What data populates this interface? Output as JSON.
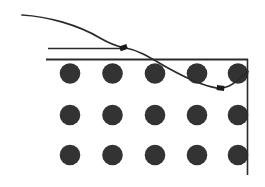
{
  "figure": {
    "title": "Descending curve over circular element array",
    "width": 265,
    "height": 187,
    "background_color": "#ffffff",
    "ink_color": "#2b2b2b",
    "circle_color": "#333333",
    "marker_color": "#1a1a1a"
  },
  "frame": {
    "name": "boundary-frame",
    "top_line": {
      "x1": 46,
      "y1": 59.5,
      "x2": 248,
      "y2": 59.5,
      "stroke_width": 2.0
    },
    "right_line": {
      "x1": 247.5,
      "y1": 59,
      "x2": 247.5,
      "y2": 175,
      "stroke_width": 1.6
    }
  },
  "guide_line": {
    "name": "upper-guide-line",
    "x1": 48,
    "y1": 48.5,
    "x2": 126,
    "y2": 48.5,
    "stroke_width": 1.6
  },
  "curve": {
    "name": "descending-profile-curve",
    "stroke_width": 1.7,
    "path": "M 22 15 C 48 16.5, 78 25, 100 38 C 112 45, 118 46.5, 124 47.5 C 140 50.5, 152 59, 168 68 C 186 78, 202 85.5, 216 87.8 C 221 88.4, 225 88.0, 229 86.0 C 236 82.3, 242 76.5, 248 71.5",
    "start_point": {
      "x": 22,
      "y": 15
    },
    "end_point": {
      "x": 248,
      "y": 71.5
    }
  },
  "markers": [
    {
      "name": "curve-marker-1",
      "x": 123.5,
      "y": 47.6,
      "w": 7.5,
      "h": 5.0,
      "rotation": -18
    },
    {
      "name": "curve-marker-2",
      "x": 220.5,
      "y": 88.0,
      "w": 7.5,
      "h": 5.0,
      "rotation": 6
    }
  ],
  "circle_grid": {
    "name": "circle-array",
    "radius": 10.3,
    "columns_x": [
      70,
      112.5,
      155,
      197,
      238
    ],
    "rows_y": [
      73.5,
      115,
      155
    ],
    "rows": [
      {
        "row_index": 0,
        "circles": [
          {
            "cx": 70,
            "cy": 73.5
          },
          {
            "cx": 112.5,
            "cy": 73.5
          },
          {
            "cx": 155,
            "cy": 73.5
          },
          {
            "cx": 197,
            "cy": 73.5
          },
          {
            "cx": 238,
            "cy": 73.5
          }
        ]
      },
      {
        "row_index": 1,
        "circles": [
          {
            "cx": 70,
            "cy": 115
          },
          {
            "cx": 112.5,
            "cy": 115
          },
          {
            "cx": 155,
            "cy": 115
          },
          {
            "cx": 197,
            "cy": 115
          },
          {
            "cx": 238,
            "cy": 115
          }
        ]
      },
      {
        "row_index": 2,
        "circles": [
          {
            "cx": 70,
            "cy": 155
          },
          {
            "cx": 112.5,
            "cy": 155
          },
          {
            "cx": 155,
            "cy": 155
          },
          {
            "cx": 197,
            "cy": 155
          },
          {
            "cx": 238,
            "cy": 155
          }
        ]
      }
    ]
  }
}
